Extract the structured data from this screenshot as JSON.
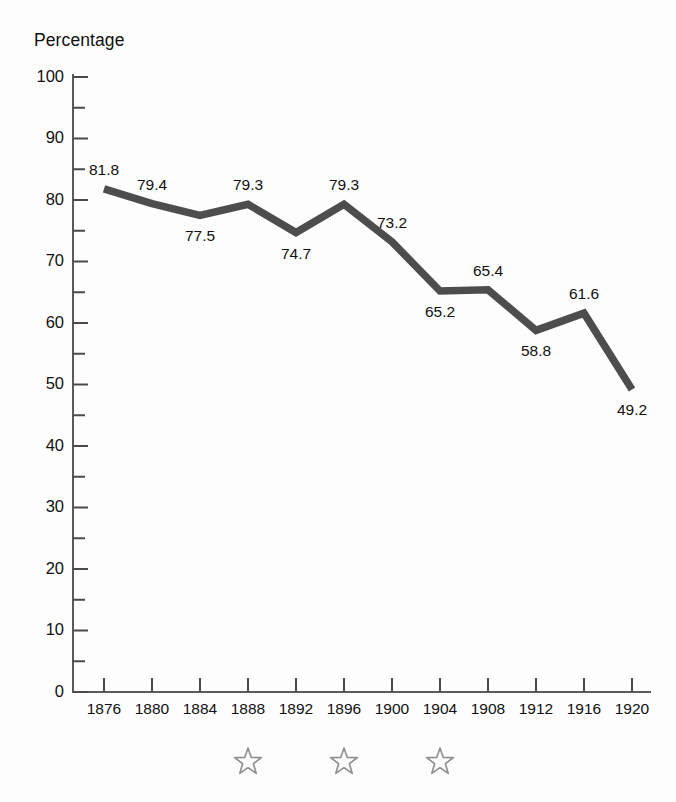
{
  "chart_data": {
    "type": "line",
    "title": "",
    "ylabel": "Percentage",
    "xlabel": "",
    "categories": [
      "1876",
      "1880",
      "1884",
      "1888",
      "1892",
      "1896",
      "1900",
      "1904",
      "1908",
      "1912",
      "1916",
      "1920"
    ],
    "values": [
      81.8,
      79.4,
      77.5,
      79.3,
      74.7,
      79.3,
      73.2,
      65.2,
      65.4,
      58.8,
      61.6,
      49.2
    ],
    "point_labels": [
      "81.8",
      "79.4",
      "77.5",
      "79.3",
      "74.7",
      "79.3",
      "73.2",
      "65.2",
      "65.4",
      "58.8",
      "61.6",
      "49.2"
    ],
    "label_positions": [
      "above",
      "above",
      "below",
      "above",
      "below",
      "above",
      "above",
      "below",
      "above",
      "below",
      "above",
      "below"
    ],
    "ylim": [
      0,
      100
    ],
    "ytick_labels": [
      "0",
      "10",
      "20",
      "30",
      "40",
      "50",
      "60",
      "70",
      "80",
      "90",
      "100"
    ],
    "ytick_values": [
      0,
      10,
      20,
      30,
      40,
      50,
      60,
      70,
      80,
      90,
      100
    ],
    "yminor_values": [
      5,
      15,
      25,
      35,
      45,
      55,
      65,
      75,
      85,
      95
    ],
    "grid": false,
    "legend": "none",
    "series_color": "#4d4d4d",
    "axis_color": "#5a5a5a",
    "annotations": {
      "star_marker_label": "star",
      "star_marker_color": "#8d8d8d",
      "star_years": [
        "1888",
        "1896",
        "1904"
      ]
    }
  },
  "axis": {
    "y_title": "Percentage"
  }
}
